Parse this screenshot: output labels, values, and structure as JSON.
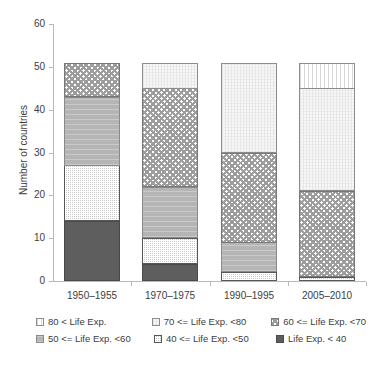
{
  "chart_data": {
    "type": "bar",
    "subtype": "stacked-bar",
    "title": "",
    "subtitle": "",
    "xlabel": "",
    "ylabel": "Number of countries",
    "categories": [
      "1950–1955",
      "1970–1975",
      "1990–1995",
      "2005–2010"
    ],
    "ylim": [
      0,
      60
    ],
    "yticks": [
      0,
      10,
      20,
      30,
      40,
      50,
      60
    ],
    "ytick_labels": [
      "0",
      "10",
      "20",
      "30",
      "40",
      "50",
      "60"
    ],
    "grid": false,
    "legend_position": "bottom",
    "stack_total_per_category": [
      51,
      51,
      51,
      51
    ],
    "series": [
      {
        "name": "80 < Life Exp.",
        "key": "80",
        "values": [
          0,
          0,
          0,
          6
        ],
        "pattern": "vertical-stripes",
        "color": "#ffffff"
      },
      {
        "name": "70 <= Life Exp. <80",
        "key": "70",
        "values": [
          0,
          6,
          21,
          24
        ],
        "pattern": "fine-dots-light",
        "color": "#f7f7f7"
      },
      {
        "name": "60 <= Life Exp. <70",
        "key": "60",
        "values": [
          8,
          23,
          21,
          20
        ],
        "pattern": "checkerboard",
        "color": "#9d9d9d"
      },
      {
        "name": "50 <= Life Exp. <60",
        "key": "50",
        "values": [
          16,
          12,
          7,
          0
        ],
        "pattern": "solid-medium-grey",
        "color": "#b5b5b5"
      },
      {
        "name": "40 <= Life Exp. <50",
        "key": "40",
        "values": [
          13,
          6,
          2,
          1
        ],
        "pattern": "dense-stipple",
        "color": "#c9c9c9"
      },
      {
        "name": "Life Exp. < 40",
        "key": "lt40",
        "values": [
          14,
          4,
          0,
          0
        ],
        "pattern": "solid-dark-grey",
        "color": "#5e5e5e"
      }
    ],
    "stack_order_bottom_to_top": [
      "Life Exp. < 40",
      "40 <= Life Exp. <50",
      "50 <= Life Exp. <60",
      "60 <= Life Exp. <70",
      "70 <= Life Exp. <80",
      "80 < Life Exp."
    ],
    "cumulative_tops": {
      "1950–1955": [
        14,
        27,
        43,
        51,
        51,
        51
      ],
      "1970–1975": [
        4,
        10,
        22,
        45,
        51,
        51
      ],
      "1990–1995": [
        0,
        2,
        9,
        30,
        51,
        51
      ],
      "2005–2010": [
        0,
        1,
        1,
        21,
        45,
        51
      ]
    }
  },
  "legend": {
    "items": [
      {
        "label": "80 < Life Exp.",
        "swatch": "pattern-vertical-stripes"
      },
      {
        "label": "70 <= Life Exp. <80",
        "swatch": "pattern-fine-dots-light"
      },
      {
        "label": "60 <= Life Exp. <70",
        "swatch": "pattern-checkerboard"
      },
      {
        "label": "50 <= Life Exp. <60",
        "swatch": "pattern-solid-medium-grey"
      },
      {
        "label": "40 <= Life Exp. <50",
        "swatch": "pattern-dense-stipple"
      },
      {
        "label": "Life Exp. < 40",
        "swatch": "pattern-solid-dark-grey"
      }
    ]
  }
}
